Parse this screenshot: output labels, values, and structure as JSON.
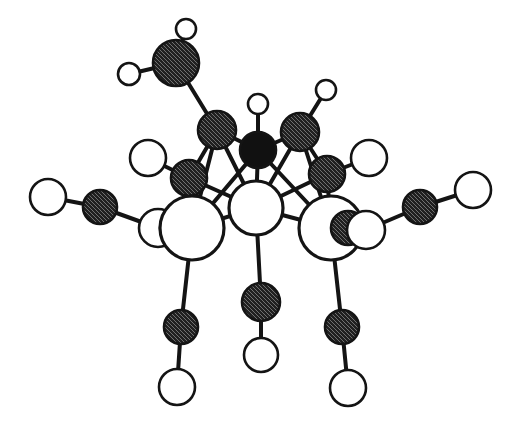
{
  "figure": {
    "kind": "molecular-structure-diagram",
    "width": 517,
    "height": 429,
    "background_color": "#FFFFFF"
  },
  "style": {
    "bond_color": "#141414",
    "bond_width_thick": 4.0,
    "bond_width_thin": 2.6,
    "outline_color": "#141414",
    "outline_width_large": 3.2,
    "outline_width_small": 2.6,
    "fill_white": "#FFFFFF",
    "fill_black": "#111111",
    "fill_hatched_base": "#8C8C8C",
    "hatch_line_color": "#1A1A1A",
    "hatch_background": "#E2E2E2"
  },
  "legend": {
    "atom_kinds": [
      {
        "id": "large-white",
        "label": "large open sphere",
        "fill": "#FFFFFF",
        "note": "largest unfilled circles"
      },
      {
        "id": "hatched",
        "label": "cross-hatched sphere",
        "fill": "#8C8C8C",
        "note": "stippled / mesh-filled circles"
      },
      {
        "id": "black",
        "label": "solid black sphere",
        "fill": "#111111",
        "note": "single filled circle near centre top"
      },
      {
        "id": "small-white",
        "label": "small open sphere",
        "fill": "#FFFFFF",
        "note": "terminal small circles"
      }
    ]
  },
  "atoms": [
    {
      "id": "a1",
      "kind": "hatched",
      "x": 176,
      "y": 63,
      "r": 23,
      "name": "hatched-atom-top-left"
    },
    {
      "id": "a2",
      "kind": "small-white",
      "x": 186,
      "y": 29,
      "r": 10,
      "name": "small-white-atom-top"
    },
    {
      "id": "a3",
      "kind": "small-white",
      "x": 129,
      "y": 74,
      "r": 11,
      "name": "small-white-atom-upper-left"
    },
    {
      "id": "a4",
      "kind": "hatched",
      "x": 217,
      "y": 130,
      "r": 19,
      "name": "hatched-atom-upper-left-core"
    },
    {
      "id": "a5",
      "kind": "black",
      "x": 258,
      "y": 150,
      "r": 18,
      "name": "black-atom-center-top"
    },
    {
      "id": "a6",
      "kind": "small-white",
      "x": 258,
      "y": 104,
      "r": 10,
      "name": "small-white-atom-above-black"
    },
    {
      "id": "a7",
      "kind": "hatched",
      "x": 300,
      "y": 132,
      "r": 19,
      "name": "hatched-atom-upper-right-core"
    },
    {
      "id": "a8",
      "kind": "small-white",
      "x": 326,
      "y": 90,
      "r": 10,
      "name": "small-white-atom-upper-right"
    },
    {
      "id": "a9",
      "kind": "hatched",
      "x": 189,
      "y": 178,
      "r": 18,
      "name": "hatched-atom-left-core"
    },
    {
      "id": "a10",
      "kind": "small-white",
      "x": 148,
      "y": 158,
      "r": 18,
      "name": "white-atom-left-upper"
    },
    {
      "id": "a11",
      "kind": "hatched",
      "x": 327,
      "y": 174,
      "r": 18,
      "name": "hatched-atom-right-core"
    },
    {
      "id": "a12",
      "kind": "small-white",
      "x": 369,
      "y": 158,
      "r": 18,
      "name": "white-atom-right-upper"
    },
    {
      "id": "a13",
      "kind": "small-white",
      "x": 48,
      "y": 197,
      "r": 18,
      "name": "white-atom-far-left"
    },
    {
      "id": "a14",
      "kind": "hatched",
      "x": 100,
      "y": 207,
      "r": 17,
      "name": "hatched-atom-far-left"
    },
    {
      "id": "a15",
      "kind": "small-white",
      "x": 158,
      "y": 228,
      "r": 19,
      "name": "white-atom-left-inner"
    },
    {
      "id": "a16",
      "kind": "hatched",
      "x": 177,
      "y": 228,
      "r": 17,
      "name": "hatched-atom-left-bridge"
    },
    {
      "id": "a17",
      "kind": "large-white",
      "x": 192,
      "y": 228,
      "r": 32,
      "name": "large-white-atom-left"
    },
    {
      "id": "a18",
      "kind": "large-white",
      "x": 256,
      "y": 208,
      "r": 27,
      "name": "large-white-atom-center"
    },
    {
      "id": "a19",
      "kind": "large-white",
      "x": 331,
      "y": 228,
      "r": 32,
      "name": "large-white-atom-right"
    },
    {
      "id": "a20",
      "kind": "hatched",
      "x": 348,
      "y": 228,
      "r": 17,
      "name": "hatched-atom-right-bridge"
    },
    {
      "id": "a21",
      "kind": "small-white",
      "x": 366,
      "y": 230,
      "r": 19,
      "name": "white-atom-right-inner"
    },
    {
      "id": "a22",
      "kind": "hatched",
      "x": 420,
      "y": 207,
      "r": 17,
      "name": "hatched-atom-far-right"
    },
    {
      "id": "a23",
      "kind": "small-white",
      "x": 473,
      "y": 190,
      "r": 18,
      "name": "white-atom-far-right"
    },
    {
      "id": "a24",
      "kind": "hatched",
      "x": 181,
      "y": 327,
      "r": 17,
      "name": "hatched-atom-bottom-left"
    },
    {
      "id": "a25",
      "kind": "small-white",
      "x": 177,
      "y": 387,
      "r": 18,
      "name": "white-atom-bottom-left"
    },
    {
      "id": "a26",
      "kind": "hatched",
      "x": 261,
      "y": 302,
      "r": 19,
      "name": "hatched-atom-bottom-center"
    },
    {
      "id": "a27",
      "kind": "small-white",
      "x": 261,
      "y": 355,
      "r": 17,
      "name": "white-atom-bottom-center"
    },
    {
      "id": "a28",
      "kind": "hatched",
      "x": 342,
      "y": 327,
      "r": 17,
      "name": "hatched-atom-bottom-right"
    },
    {
      "id": "a29",
      "kind": "small-white",
      "x": 348,
      "y": 388,
      "r": 18,
      "name": "white-atom-bottom-right"
    }
  ],
  "bonds": [
    {
      "from": "a1",
      "to": "a2",
      "width": "thick"
    },
    {
      "from": "a1",
      "to": "a3",
      "width": "thick"
    },
    {
      "from": "a1",
      "to": "a4",
      "width": "thick"
    },
    {
      "from": "a4",
      "to": "a5",
      "width": "thick"
    },
    {
      "from": "a5",
      "to": "a6",
      "width": "thick"
    },
    {
      "from": "a5",
      "to": "a7",
      "width": "thick"
    },
    {
      "from": "a7",
      "to": "a8",
      "width": "thick"
    },
    {
      "from": "a4",
      "to": "a9",
      "width": "thick"
    },
    {
      "from": "a9",
      "to": "a10",
      "width": "thick"
    },
    {
      "from": "a7",
      "to": "a11",
      "width": "thick"
    },
    {
      "from": "a11",
      "to": "a12",
      "width": "thick"
    },
    {
      "from": "a13",
      "to": "a14",
      "width": "thick"
    },
    {
      "from": "a14",
      "to": "a15",
      "width": "thick"
    },
    {
      "from": "a22",
      "to": "a23",
      "width": "thick"
    },
    {
      "from": "a21",
      "to": "a22",
      "width": "thick"
    },
    {
      "from": "a17",
      "to": "a24",
      "width": "thick"
    },
    {
      "from": "a24",
      "to": "a25",
      "width": "thick"
    },
    {
      "from": "a18",
      "to": "a26",
      "width": "thick"
    },
    {
      "from": "a26",
      "to": "a27",
      "width": "thick"
    },
    {
      "from": "a19",
      "to": "a28",
      "width": "thick"
    },
    {
      "from": "a28",
      "to": "a29",
      "width": "thick"
    },
    {
      "from": "a4",
      "to": "a17",
      "width": "thick"
    },
    {
      "from": "a4",
      "to": "a18",
      "width": "thick"
    },
    {
      "from": "a5",
      "to": "a17",
      "width": "thick"
    },
    {
      "from": "a5",
      "to": "a18",
      "width": "thick"
    },
    {
      "from": "a5",
      "to": "a19",
      "width": "thick"
    },
    {
      "from": "a7",
      "to": "a18",
      "width": "thick"
    },
    {
      "from": "a7",
      "to": "a19",
      "width": "thick"
    },
    {
      "from": "a9",
      "to": "a17",
      "width": "thick"
    },
    {
      "from": "a9",
      "to": "a18",
      "width": "thick"
    },
    {
      "from": "a11",
      "to": "a18",
      "width": "thick"
    },
    {
      "from": "a11",
      "to": "a19",
      "width": "thick"
    },
    {
      "from": "a17",
      "to": "a18",
      "width": "thick"
    },
    {
      "from": "a18",
      "to": "a19",
      "width": "thick"
    }
  ]
}
